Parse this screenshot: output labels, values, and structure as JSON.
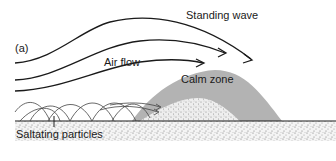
{
  "figure": {
    "panel_label": "(a)",
    "labels": {
      "standing_wave": "Standing wave",
      "air_flow": "Air flow",
      "calm_zone": "Calm zone",
      "saltating_particles": "Saltating particles"
    },
    "colors": {
      "line": "#1a1a1a",
      "calm_zone_fill": "#b3b3b3",
      "ground_stipple": "#9a9a9a",
      "background": "#ffffff"
    }
  }
}
